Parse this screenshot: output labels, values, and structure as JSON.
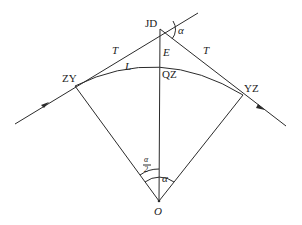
{
  "diagram": {
    "points": {
      "jd": {
        "label": "JD",
        "x": 160,
        "y": 29
      },
      "zy": {
        "label": "ZY",
        "x": 75,
        "y": 86
      },
      "yz": {
        "label": "YZ",
        "x": 243,
        "y": 95
      },
      "qz": {
        "label": "QZ",
        "x": 160,
        "y": 64
      },
      "o": {
        "label": "O",
        "x": 159,
        "y": 201
      }
    },
    "labels": {
      "tangent_left": "T",
      "tangent_right": "T",
      "external_distance": "E",
      "curve_length": "L",
      "deflection_angle_top": "α",
      "central_angle": "α",
      "half_angle_num": "α",
      "half_angle_den": "2"
    },
    "colors": {
      "line": "#2b2b2b",
      "text": "#222222",
      "background": "#ffffff"
    }
  }
}
